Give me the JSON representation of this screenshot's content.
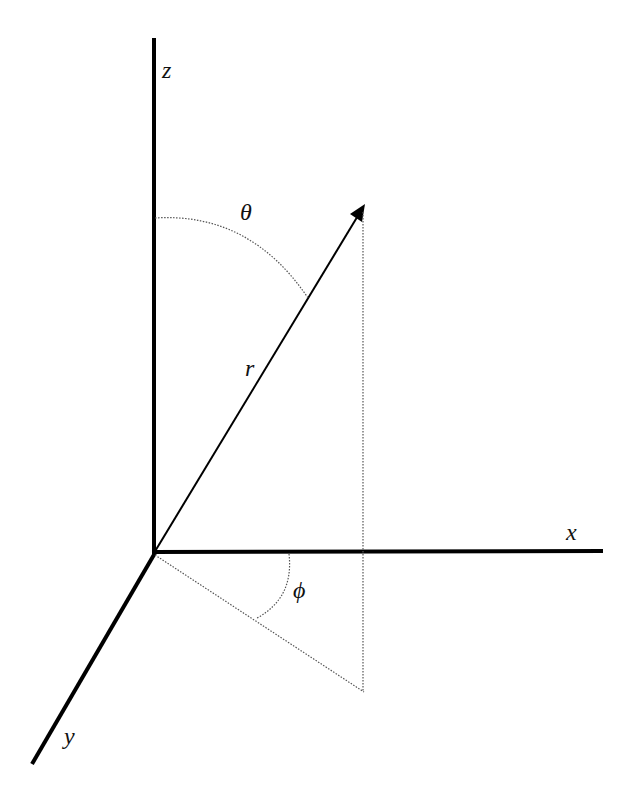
{
  "diagram": {
    "axes": {
      "x_label": "x",
      "y_label": "y",
      "z_label": "z"
    },
    "vector": {
      "label": "r"
    },
    "angles": {
      "polar_label": "θ",
      "azimuth_label": "ϕ"
    },
    "colors": {
      "axis": "#000000",
      "guide": "#555555",
      "background": "#ffffff"
    }
  }
}
